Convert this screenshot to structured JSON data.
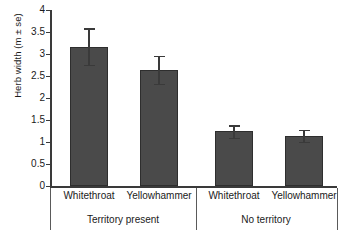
{
  "chart_data": {
    "type": "bar",
    "title": "",
    "xlabel": "",
    "ylabel": "Herb width (m ± se)",
    "ylim": [
      0,
      4
    ],
    "ytick_labels": [
      "0",
      "0.5",
      "1",
      "1.5",
      "2",
      "2.5",
      "3",
      "3.5",
      "4"
    ],
    "ytick_values": [
      0,
      0.5,
      1,
      1.5,
      2,
      2.5,
      3,
      3.5,
      4
    ],
    "grid": false,
    "legend": null,
    "error_type": "se",
    "categories": [
      "Whitethroat",
      "Yellowhammer",
      "Whitethroat",
      "Yellowhammer"
    ],
    "groups": [
      {
        "label": "Territory present",
        "categories": [
          "Whitethroat",
          "Yellowhammer"
        ]
      },
      {
        "label": "No territory",
        "categories": [
          "Whitethroat",
          "Yellowhammer"
        ]
      }
    ],
    "values": [
      3.17,
      2.64,
      1.24,
      1.14
    ],
    "errors": [
      0.41,
      0.32,
      0.14,
      0.14
    ],
    "bars": [
      {
        "label": "Whitethroat",
        "group": "Territory present",
        "value": 3.17,
        "error": 0.41
      },
      {
        "label": "Yellowhammer",
        "group": "Territory present",
        "value": 2.64,
        "error": 0.32
      },
      {
        "label": "Whitethroat",
        "group": "No territory",
        "value": 1.24,
        "error": 0.14
      },
      {
        "label": "Yellowhammer",
        "group": "No territory",
        "value": 1.14,
        "error": 0.14
      }
    ],
    "colors": {
      "bar_fill": "#4a4a4a",
      "bar_edge": "#2e2e2e",
      "axis": "#3a3a3a",
      "text": "#1a1a1a",
      "background": "#ffffff"
    }
  }
}
